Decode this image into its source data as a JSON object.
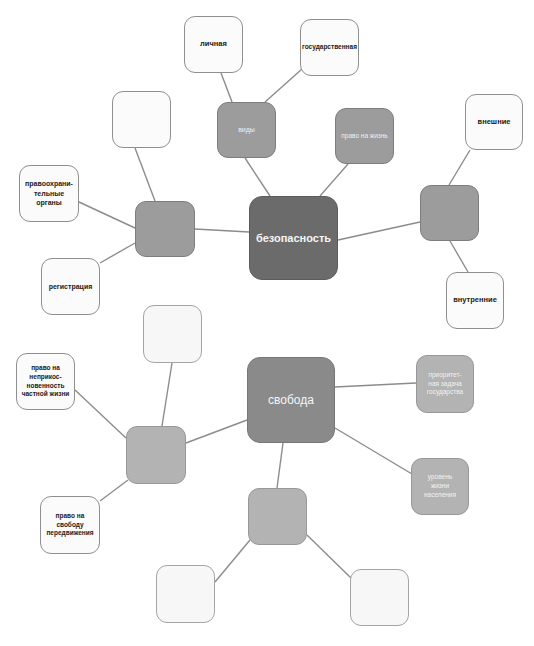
{
  "diagram": {
    "type": "mind-map",
    "maps": [
      {
        "center": "безопасность",
        "branches": [
          {
            "label": "виды",
            "children": [
              "личная",
              "государственная"
            ]
          },
          {
            "label": "право на жизнь",
            "children": []
          },
          {
            "label": "",
            "children": [
              "внешние",
              "внутренние"
            ]
          },
          {
            "label": "",
            "children": [
              "",
              "правоохранительные органы",
              "регистрация"
            ]
          }
        ]
      },
      {
        "center": "свобода",
        "branches": [
          {
            "label": "приоритетная задача государства",
            "children": []
          },
          {
            "label": "уровень жизни населения",
            "children": []
          },
          {
            "label": "",
            "children": [
              "",
              ""
            ]
          },
          {
            "label": "",
            "children": [
              "",
              "право на неприкосновенность частной жизни",
              "право на свободу передвижения"
            ]
          }
        ]
      }
    ]
  },
  "nodes": {
    "security_center": "безопасность",
    "kinds": "виды",
    "personal": "личная",
    "state": "государственная",
    "right_to_life": "право на жизнь",
    "external": "внешние",
    "internal": "внутренние",
    "law_enforcement": "правоохрани-\nтельные\nорганы",
    "registration": "регистрация",
    "freedom_center": "свобода",
    "priority_task": "приоритет-\nная задача\nгосударства",
    "living_standard": "уровень\nжизни\nнаселения",
    "privacy": "право на\nнеприкос-\nновенность\nчастной жизни",
    "movement": "право на\nсвободу\nпередвижения",
    "empty": ""
  },
  "colors": {
    "edge": "#8c8c8c",
    "dark_center": "#6b6b6b",
    "freedom_center": "#8a8a8a",
    "mid_node": "#9c9c9c",
    "light_node": "#b3b3b3",
    "white_node": "#fbfbfb"
  }
}
